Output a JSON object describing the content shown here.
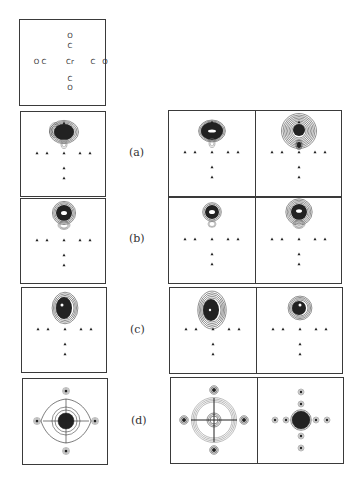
{
  "figure": {
    "molecule_key": {
      "name": "Cr(CO)6 cross-section",
      "atoms": [
        {
          "label": "O",
          "x": 50,
          "y": 16
        },
        {
          "label": "C",
          "x": 50,
          "y": 26
        },
        {
          "label": "O C",
          "x": 20,
          "y": 42
        },
        {
          "label": "Cr",
          "x": 50,
          "y": 42
        },
        {
          "label": "C",
          "x": 73,
          "y": 42
        },
        {
          "label": "O",
          "x": 85,
          "y": 42
        },
        {
          "label": "C",
          "x": 50,
          "y": 59
        },
        {
          "label": "O",
          "x": 50,
          "y": 68
        }
      ]
    },
    "rows": [
      {
        "label": "(a)",
        "type": "sigma lobe, broad"
      },
      {
        "label": "(b)",
        "type": "compact upper lobe"
      },
      {
        "label": "(c)",
        "type": "dense upper lobe, offset"
      },
      {
        "label": "(d)",
        "type": "four-fold symmetric"
      }
    ],
    "markers": {
      "glyph": "triangle",
      "horizontal_x": [
        16,
        26,
        43,
        59,
        69
      ],
      "horizontal_y": 41,
      "vertical_y": [
        56,
        66
      ],
      "center_x": 43
    },
    "colors": {
      "border": "#3a3a3a",
      "contour": "#222222",
      "contour_light": "#777777",
      "background": "#ffffff"
    }
  }
}
